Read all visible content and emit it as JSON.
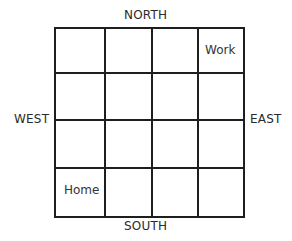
{
  "diagram": {
    "type": "grid-map",
    "rows": 4,
    "cols": 4,
    "directions": {
      "north": "NORTH",
      "south": "SOUTH",
      "west": "WEST",
      "east": "EAST"
    },
    "cells": [
      {
        "row": 0,
        "col": 3,
        "label": "Work"
      },
      {
        "row": 3,
        "col": 0,
        "label": "Home"
      }
    ],
    "line_color": "#1e1e1e"
  }
}
